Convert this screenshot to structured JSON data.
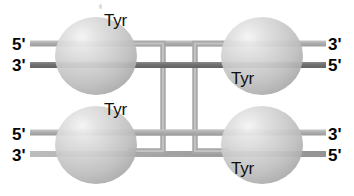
{
  "diagram": {
    "background_color": "#ffffff",
    "colors": {
      "strand_light": "#b0b0b0",
      "strand_dark": "#6e6e6e",
      "strand_mid": "#9a9a9a",
      "protein_fill": "#c9c9c9",
      "protein_highlight": "#f1f1f1",
      "protein_shadow": "#a6a6a6",
      "text": "#101010"
    },
    "protein_subunits": [
      {
        "id": "top-left",
        "label": "Tyr",
        "label_position": "above-right",
        "cx": 96,
        "cy": 56,
        "rx": 41,
        "ry": 39
      },
      {
        "id": "top-right",
        "label": "Tyr",
        "label_position": "below-left",
        "cx": 262,
        "cy": 56,
        "rx": 41,
        "ry": 39
      },
      {
        "id": "bottom-left",
        "label": "Tyr",
        "label_position": "above-right",
        "cx": 96,
        "cy": 145,
        "rx": 41,
        "ry": 39
      },
      {
        "id": "bottom-right",
        "label": "Tyr",
        "label_position": "below-left",
        "cx": 262,
        "cy": 145,
        "rx": 41,
        "ry": 39
      }
    ],
    "tyr_labels": [
      {
        "text": "Tyr",
        "left": 104,
        "top": 12
      },
      {
        "text": "Tyr",
        "left": 231,
        "top": 70
      },
      {
        "text": "Tyr",
        "left": 104,
        "top": 101
      },
      {
        "text": "Tyr",
        "left": 231,
        "top": 160
      }
    ],
    "end_labels": [
      {
        "text": "5'",
        "side": "left",
        "arm": "top",
        "left": 12,
        "top": 36
      },
      {
        "text": "3'",
        "side": "left",
        "arm": "top",
        "left": 12,
        "top": 57
      },
      {
        "text": "3'",
        "side": "right",
        "arm": "top",
        "left": 328,
        "top": 36
      },
      {
        "text": "5'",
        "side": "right",
        "arm": "top",
        "left": 328,
        "top": 57
      },
      {
        "text": "5'",
        "side": "left",
        "arm": "bottom",
        "left": 12,
        "top": 126
      },
      {
        "text": "3'",
        "side": "left",
        "arm": "bottom",
        "left": 12,
        "top": 147
      },
      {
        "text": "3'",
        "side": "right",
        "arm": "bottom",
        "left": 328,
        "top": 126
      },
      {
        "text": "5'",
        "side": "right",
        "arm": "bottom",
        "left": 328,
        "top": 147
      }
    ],
    "dna_duplexes": [
      {
        "id": "top-left-arm",
        "strand_a_y": 44,
        "strand_b_y": 65,
        "x_start": 30,
        "x_end": 160
      },
      {
        "id": "top-right-arm",
        "strand_a_y": 44,
        "strand_b_y": 65,
        "x_start": 196,
        "x_end": 326
      },
      {
        "id": "bottom-left-arm",
        "strand_a_y": 133,
        "strand_b_y": 154,
        "x_start": 30,
        "x_end": 160
      },
      {
        "id": "bottom-right-arm",
        "strand_a_y": 133,
        "strand_b_y": 154,
        "x_start": 196,
        "x_end": 326
      }
    ],
    "crossover": {
      "description": "Two exchanged strands form vertical bracket connectors between the upper and lower duplexes",
      "left_bracket_x": 160,
      "right_bracket_x": 196,
      "top_y": 44,
      "bottom_y": 154
    }
  }
}
